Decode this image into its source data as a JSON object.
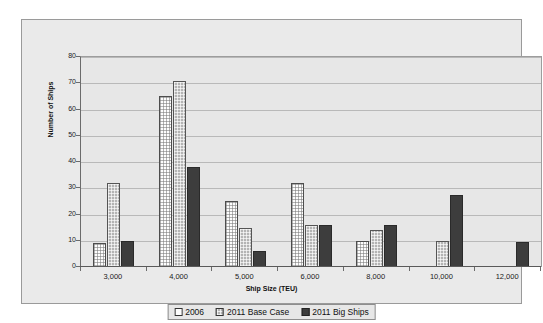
{
  "chart_data": {
    "type": "bar",
    "title": "",
    "xlabel": "Ship Size (TEU)",
    "ylabel": "Number of Ships",
    "categories": [
      "3,000",
      "4,000",
      "5,000",
      "6,000",
      "8,000",
      "10,000",
      "12,000"
    ],
    "series": [
      {
        "name": "2006",
        "values": [
          9,
          65,
          25,
          32,
          10,
          0,
          0
        ]
      },
      {
        "name": "2011 Base Case",
        "values": [
          32,
          71,
          15,
          16,
          14,
          10,
          0
        ]
      },
      {
        "name": "2011 Big Ships",
        "values": [
          10,
          38,
          6,
          16,
          16,
          27.5,
          9.5
        ]
      }
    ],
    "ylim": [
      0,
      80
    ],
    "yticks": [
      0,
      10,
      20,
      30,
      40,
      50,
      60,
      70,
      80
    ],
    "ytick_labels": [
      "0",
      "10",
      "20",
      "30",
      "40",
      "50",
      "60",
      "70",
      "80"
    ],
    "grid": true,
    "legend_position": "bottom-center",
    "colors": {
      "series_2006": "#fdfdfd",
      "series_2011_base_case": "#b4b4b4",
      "series_2011_big_ships": "#3d3d3d",
      "plot_background": "#e7e7e7",
      "frame_background": "#eaeaea",
      "gridline": "#b9b9b9",
      "axis": "#5a5a5a",
      "text": "#111111"
    }
  }
}
